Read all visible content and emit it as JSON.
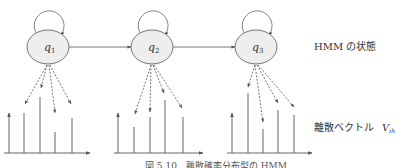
{
  "diagram": {
    "states": [
      {
        "id": "q1",
        "label": "q",
        "subscript": "1",
        "cx": 48,
        "cy": 47
      },
      {
        "id": "q2",
        "label": "q",
        "subscript": "2",
        "cx": 152,
        "cy": 47
      },
      {
        "id": "q3",
        "label": "q",
        "subscript": "3",
        "cx": 256,
        "cy": 47
      }
    ],
    "transitions": [
      {
        "from": "q1",
        "to": "q1",
        "type": "self-loop"
      },
      {
        "from": "q1",
        "to": "q2"
      },
      {
        "from": "q2",
        "to": "q2",
        "type": "self-loop"
      },
      {
        "from": "q2",
        "to": "q3"
      },
      {
        "from": "q3",
        "to": "q3",
        "type": "self-loop"
      }
    ],
    "distributions": [
      {
        "state": "q1",
        "bar_heights": [
          40,
          56,
          21,
          35
        ]
      },
      {
        "state": "q2",
        "bar_heights": [
          26,
          36,
          53,
          36
        ]
      },
      {
        "state": "q3",
        "bar_heights": [
          60,
          24,
          43,
          38
        ]
      }
    ]
  },
  "labels": {
    "hmm_state": "HMM の状態",
    "discrete_vector": "離散ベクトル",
    "vector_symbol": "V",
    "vector_subscript": "ih"
  },
  "caption": "図 5.10　離散確率分布型の HMM",
  "colors": {
    "stroke": "#555555",
    "node_fill": "#eeeeee",
    "text": "#333333"
  }
}
